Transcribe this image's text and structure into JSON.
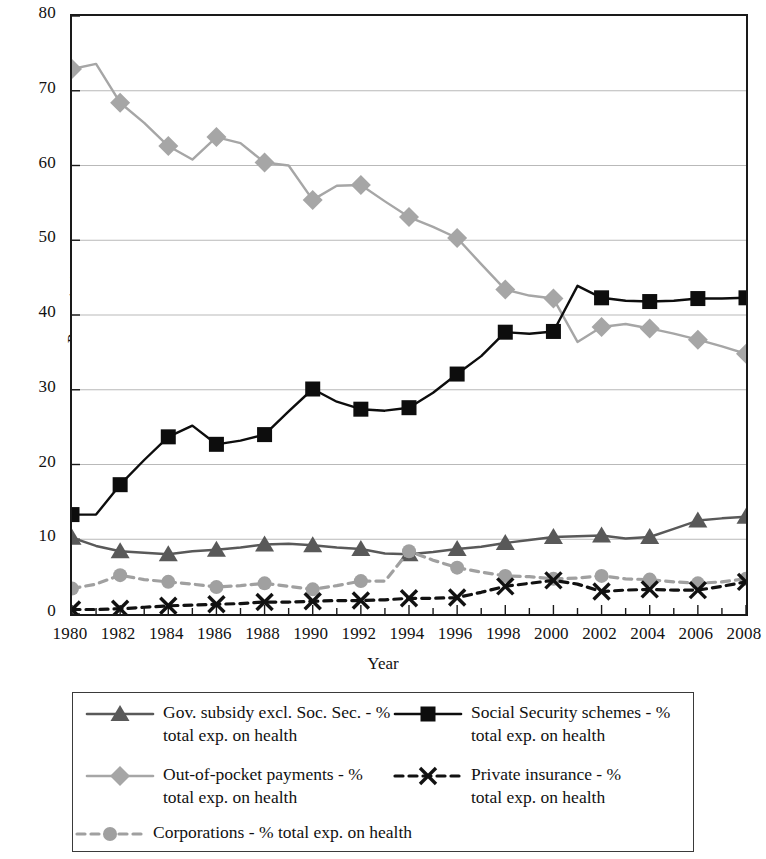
{
  "chart_data": {
    "type": "line",
    "title": "",
    "xlabel": "Year",
    "ylabel": "Percentage",
    "xlim": [
      1980,
      2008
    ],
    "ylim": [
      0,
      80
    ],
    "yticks": [
      0,
      10,
      20,
      30,
      40,
      50,
      60,
      70,
      80
    ],
    "xticks": [
      1980,
      1982,
      1984,
      1986,
      1988,
      1990,
      1992,
      1994,
      1996,
      1998,
      2000,
      2002,
      2004,
      2006,
      2008
    ],
    "xtick_labels": [
      "1980",
      "1982",
      "1984",
      "1986",
      "1988",
      "1990",
      "1992",
      "1994",
      "1996",
      "1998",
      "2000",
      "2002",
      "2004",
      "2006",
      "2008"
    ],
    "ytick_labels": [
      "0",
      "10",
      "20",
      "30",
      "40",
      "50",
      "60",
      "70",
      "80"
    ],
    "minor_xticks_every": 1,
    "grid": "horizontal",
    "legend_position": "below-plot",
    "x": [
      1980,
      1981,
      1982,
      1983,
      1984,
      1985,
      1986,
      1987,
      1988,
      1989,
      1990,
      1991,
      1992,
      1993,
      1994,
      1995,
      1996,
      1997,
      1998,
      1999,
      2000,
      2001,
      2002,
      2003,
      2004,
      2005,
      2006,
      2007,
      2008
    ],
    "series": [
      {
        "name": "Gov. subsidy excl. Soc. Sec. - % total exp. on health",
        "marker": "triangle",
        "color": "#595959",
        "linestyle": "solid",
        "markers_every": 2,
        "values": [
          10.2,
          9.1,
          8.4,
          8.2,
          8.0,
          8.4,
          8.6,
          8.9,
          9.3,
          9.4,
          9.2,
          8.9,
          8.7,
          8.1,
          8.0,
          8.3,
          8.7,
          9.0,
          9.5,
          9.9,
          10.3,
          10.4,
          10.5,
          10.1,
          10.3,
          11.4,
          12.5,
          12.8,
          13.0
        ]
      },
      {
        "name": "Social Security schemes - % total exp. on health",
        "marker": "square",
        "color": "#0d0d0d",
        "linestyle": "solid",
        "markers_every": 2,
        "values": [
          13.3,
          13.3,
          17.3,
          20.6,
          23.7,
          25.2,
          22.7,
          23.2,
          24.0,
          27.1,
          30.1,
          28.4,
          27.4,
          27.2,
          27.6,
          29.6,
          32.1,
          34.5,
          37.7,
          37.5,
          37.8,
          43.9,
          42.3,
          41.9,
          41.8,
          41.9,
          42.2,
          42.2,
          42.3
        ]
      },
      {
        "name": "Out-of-pocket payments - % total exp. on health",
        "marker": "diamond",
        "color": "#a6a6a6",
        "linestyle": "solid",
        "markers_every": 2,
        "values": [
          72.9,
          73.6,
          68.4,
          65.7,
          62.6,
          60.8,
          63.8,
          63.0,
          60.4,
          60.0,
          55.4,
          57.3,
          57.4,
          55.2,
          53.1,
          51.8,
          50.3,
          46.8,
          43.4,
          42.6,
          42.2,
          36.4,
          38.4,
          38.8,
          38.2,
          37.5,
          36.7,
          35.8,
          34.8
        ]
      },
      {
        "name": "Private insurance - % total exp. on health",
        "marker": "x",
        "color": "#111111",
        "linestyle": "dashed",
        "markers_every": 2,
        "values": [
          0.6,
          0.6,
          0.7,
          0.9,
          1.1,
          1.2,
          1.3,
          1.4,
          1.6,
          1.6,
          1.7,
          1.8,
          1.8,
          1.9,
          2.1,
          2.1,
          2.2,
          2.9,
          3.7,
          4.1,
          4.5,
          4.0,
          3.0,
          3.2,
          3.3,
          3.2,
          3.2,
          3.7,
          4.3
        ]
      },
      {
        "name": "Corporations - % total exp. on health",
        "marker": "circle",
        "color": "#a0a0a0",
        "linestyle": "dashed",
        "markers_every": 2,
        "values": [
          3.4,
          4.0,
          5.2,
          4.6,
          4.3,
          4.0,
          3.6,
          3.8,
          4.1,
          3.7,
          3.3,
          3.8,
          4.4,
          4.4,
          8.4,
          7.2,
          6.2,
          5.6,
          5.1,
          5.0,
          4.7,
          4.8,
          5.1,
          4.7,
          4.6,
          4.3,
          4.1,
          4.3,
          4.7
        ]
      }
    ]
  },
  "axis": {
    "ylabel": "Percentage",
    "xlabel": "Year"
  },
  "legend": {
    "entries": [
      {
        "marker": "triangle",
        "linestyle": "solid",
        "color": "#595959",
        "line1": "Gov. subsidy excl. Soc. Sec. - %",
        "line2": "total exp. on health"
      },
      {
        "marker": "square",
        "linestyle": "solid",
        "color": "#0d0d0d",
        "line1": "Social Security schemes - %",
        "line2": "total exp. on health"
      },
      {
        "marker": "diamond",
        "linestyle": "solid",
        "color": "#a6a6a6",
        "line1": "Out-of-pocket payments - %",
        "line2": "total exp. on health"
      },
      {
        "marker": "x",
        "linestyle": "dashed",
        "color": "#111111",
        "line1": "Private insurance - %",
        "line2": "total exp. on health"
      },
      {
        "marker": "circle",
        "linestyle": "dashed",
        "color": "#a0a0a0",
        "line1": "Corporations - % total exp. on health",
        "line2": ""
      }
    ]
  }
}
